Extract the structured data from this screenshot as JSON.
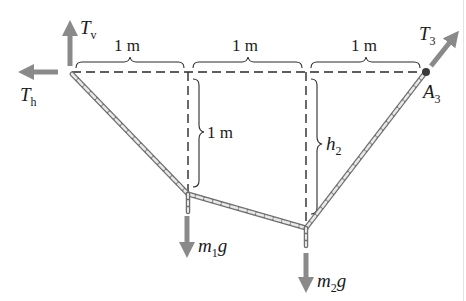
{
  "diagram": {
    "type": "rope-and-masses statics figure",
    "colors": {
      "dashed_line": "#2a2a2a",
      "arrow": "#8a8a8a",
      "rope_outer": "#6f6f6f",
      "rope_inner": "#e8e8e8",
      "text": "#1a1a1a"
    },
    "horizontal_spans": [
      {
        "label": "1 m"
      },
      {
        "label": "1 m"
      },
      {
        "label": "1 m"
      }
    ],
    "vertical_spans": [
      {
        "label": "1 m"
      },
      {
        "label_main": "h",
        "label_sub": "2"
      }
    ],
    "forces": {
      "tv": {
        "main": "T",
        "sub": "v"
      },
      "th": {
        "main": "T",
        "sub": "h"
      },
      "t3": {
        "main": "T",
        "sub": "3"
      },
      "m1g": {
        "pre": "m",
        "sub": "1",
        "post": "g"
      },
      "m2g": {
        "pre": "m",
        "sub": "2",
        "post": "g"
      }
    },
    "points": {
      "a3": {
        "main": "A",
        "sub": "3"
      }
    }
  }
}
